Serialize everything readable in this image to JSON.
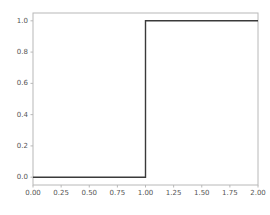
{
  "chart_data": {
    "type": "line",
    "title": "",
    "xlabel": "",
    "ylabel": "",
    "xlim": [
      0.0,
      2.0
    ],
    "ylim": [
      -0.05,
      1.05
    ],
    "grid": false,
    "legend": null,
    "drawstyle": "steps-post",
    "line_color": "#3a3a3a",
    "line_width": 1.4,
    "series": [
      {
        "name": "step",
        "x": [
          0.0,
          0.25,
          0.5,
          0.75,
          1.0,
          1.25,
          1.5,
          1.75,
          2.0
        ],
        "values": [
          0.0,
          0.0,
          0.0,
          0.0,
          1.0,
          1.0,
          1.0,
          1.0,
          1.0
        ]
      }
    ],
    "xticks": [
      0.0,
      0.25,
      0.5,
      0.75,
      1.0,
      1.25,
      1.5,
      1.75,
      2.0
    ],
    "xtick_labels": [
      "0.00",
      "0.25",
      "0.50",
      "0.75",
      "1.00",
      "1.25",
      "1.50",
      "1.75",
      "2.00"
    ],
    "yticks": [
      0.0,
      0.2,
      0.4,
      0.6,
      0.8,
      1.0
    ],
    "ytick_labels": [
      "0.0",
      "0.2",
      "0.4",
      "0.6",
      "0.8",
      "1.0"
    ],
    "spine_color": "#b8b8b8",
    "tick_label_color": "#555555",
    "background_color": "#ffffff"
  }
}
